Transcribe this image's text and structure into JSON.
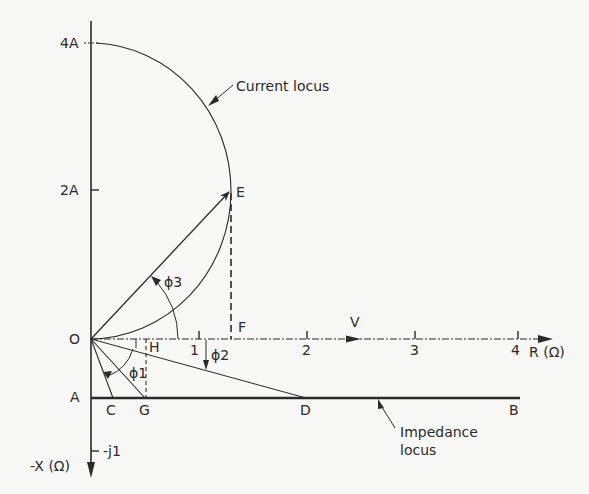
{
  "diagram": {
    "type": "circle-diagram",
    "axes": {
      "horizontal_label": "R (Ω)",
      "vertical_down_label": "-X (Ω)",
      "origin_label": "O",
      "r_ticks": [
        "1",
        "2",
        "3",
        "4"
      ],
      "current_ticks": [
        "2A",
        "4A"
      ],
      "reactance_tick": "-j1"
    },
    "points": {
      "A": "A",
      "B": "B",
      "C": "C",
      "D": "D",
      "E": "E",
      "F": "F",
      "G": "G",
      "H": "H"
    },
    "angles": {
      "phi1": "ϕ1",
      "phi2": "ϕ2",
      "phi3": "ϕ3"
    },
    "labels": {
      "voltage": "V",
      "current_locus": "Current locus",
      "impedance_locus_line1": "Impedance",
      "impedance_locus_line2": "locus"
    },
    "colors": {
      "ink": "#2a2a2a",
      "paper": "#f8f8f6"
    }
  }
}
